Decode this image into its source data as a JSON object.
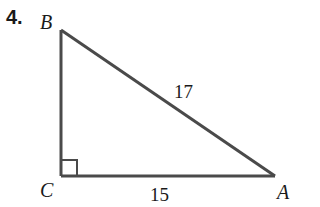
{
  "problem": {
    "number": "4."
  },
  "triangle": {
    "vertices": {
      "A": {
        "label": "A",
        "x": 275,
        "y": 176
      },
      "B": {
        "label": "B",
        "x": 61,
        "y": 30
      },
      "C": {
        "label": "C",
        "x": 61,
        "y": 176
      }
    },
    "right_angle_at": "C",
    "sides": {
      "hypotenuse_AB": {
        "label": "17"
      },
      "leg_CA": {
        "label": "15"
      },
      "leg_BC": {
        "label": ""
      }
    },
    "stroke_color": "#4a4a4a"
  }
}
